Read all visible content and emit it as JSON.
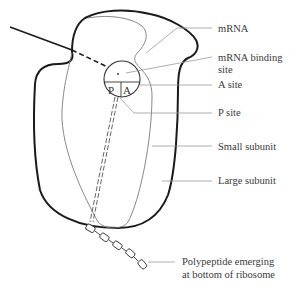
{
  "diagram": {
    "type": "ribosome-structure",
    "colors": {
      "outline": "#1a1a1a",
      "inner_line": "#7a7a7a",
      "leader_line": "#9a9a9a",
      "text": "#3a3a3a"
    },
    "circle_labels": {
      "p": "P",
      "a": "A"
    },
    "labels": [
      {
        "id": "mrna",
        "text": "mRNA"
      },
      {
        "id": "mrna-binding-site",
        "lines": [
          "mRNA binding",
          "site"
        ]
      },
      {
        "id": "a-site",
        "text": "A site"
      },
      {
        "id": "p-site",
        "text": "P site"
      },
      {
        "id": "small-subunit",
        "text": "Small subunit"
      },
      {
        "id": "large-subunit",
        "text": "Large subunit"
      },
      {
        "id": "polypeptide",
        "lines": [
          "Polypeptide emerging",
          "at bottom of ribosome"
        ]
      }
    ]
  }
}
